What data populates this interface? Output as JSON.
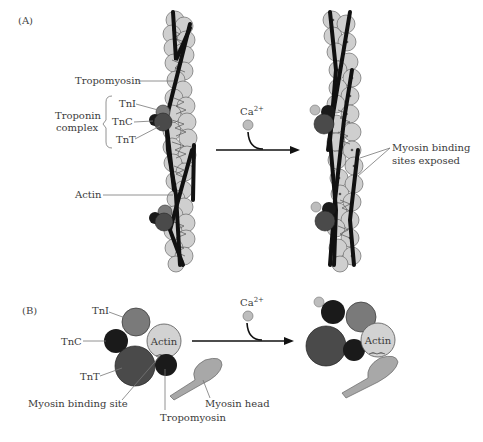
{
  "panel_a": {
    "label": "(A)",
    "labels": {
      "tropomyosin": "Tropomyosin",
      "troponin_complex_line1": "Troponin",
      "troponin_complex_line2": "complex",
      "tni": "TnI",
      "tnc": "TnC",
      "tnt": "TnT",
      "actin": "Actin",
      "calcium": "Ca2+",
      "calcium_base": "Ca",
      "calcium_sup": "2+",
      "exposed_line1": "Myosin binding",
      "exposed_line2": "sites exposed"
    }
  },
  "panel_b": {
    "label": "(B)",
    "labels": {
      "tni": "TnI",
      "tnc": "TnC",
      "tnt": "TnT",
      "actin_left": "Actin",
      "actin_right": "Actin",
      "myosin_binding_site": "Myosin binding site",
      "tropomyosin": "Tropomyosin",
      "myosin_head": "Myosin head",
      "calcium_base": "Ca",
      "calcium_sup": "2+"
    }
  },
  "colors": {
    "actin": "#cfcfcf",
    "tni": "#7a7a7a",
    "tnc": "#1a1a1a",
    "tnt": "#4a4a4a",
    "tropomyosin": "#111111",
    "myosin": "#a8a8a8",
    "calcium": "#bdbdbd"
  }
}
